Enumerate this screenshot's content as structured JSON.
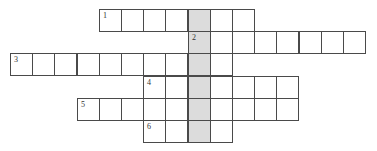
{
  "puzzle": {
    "type": "crossword",
    "cell_size": 22.2,
    "origin": {
      "x": 10,
      "y": 9
    },
    "shaded_color": "#dcdcdc",
    "border_color": "#4a4a4a",
    "shaded_column": 8,
    "rows": [
      {
        "row": 0,
        "start_col": 4,
        "end_col": 10,
        "number": "1"
      },
      {
        "row": 1,
        "start_col": 8,
        "end_col": 15,
        "number": "2"
      },
      {
        "row": 2,
        "start_col": 0,
        "end_col": 9,
        "number": "3"
      },
      {
        "row": 3,
        "start_col": 6,
        "end_col": 12,
        "number": "4"
      },
      {
        "row": 4,
        "start_col": 3,
        "end_col": 12,
        "number": "5"
      },
      {
        "row": 5,
        "start_col": 6,
        "end_col": 9,
        "number": "6"
      }
    ]
  }
}
